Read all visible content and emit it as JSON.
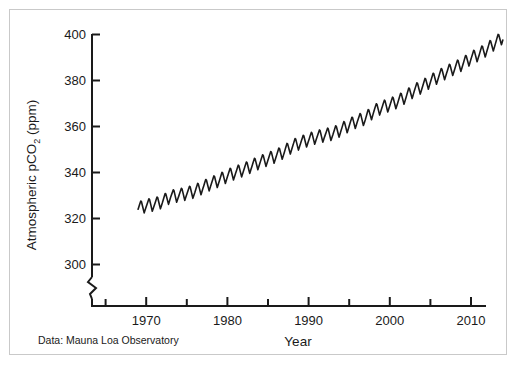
{
  "figure": {
    "background_color": "#ffffff",
    "frame_color": "#c9c9c9",
    "line_color": "#1a1a1a"
  },
  "chart_data": {
    "type": "line",
    "title": "",
    "subtitle": "",
    "xlabel": "Year",
    "ylabel": "Atmospheric pCO2 (ppm)",
    "ylabel_main": "Atmospheric pCO",
    "ylabel_sub": "2",
    "ylabel_unit": " (ppm)",
    "source_note": "Data: Mauna Loa Observatory",
    "grid": false,
    "legend": "none",
    "axis_break": true,
    "axis_break_note": "y-axis broken between 0 and 300",
    "xlim": [
      1965,
      2014
    ],
    "ylim": [
      296,
      402
    ],
    "xticks": [
      1970,
      1980,
      1990,
      2000,
      2010
    ],
    "xticks_minor": [
      1965,
      1975,
      1985,
      1995,
      2005
    ],
    "xtick_labels": [
      "1970",
      "1980",
      "1990",
      "2000",
      "2010"
    ],
    "yticks": [
      300,
      320,
      340,
      360,
      380,
      400
    ],
    "ytick_labels": [
      "300",
      "320",
      "340",
      "360",
      "380",
      "400"
    ],
    "series": [
      {
        "name": "Atmospheric pCO2 (Mauna Loa)",
        "color": "#1a1a1a",
        "description": "Keeling curve: monthly mean atmospheric CO2 with seasonal sawtooth oscillation superimposed on a rising trend",
        "seasonal_amplitude_ppm": 6.0,
        "x": [
          1969,
          1970,
          1971,
          1972,
          1973,
          1974,
          1975,
          1976,
          1977,
          1978,
          1979,
          1980,
          1981,
          1982,
          1983,
          1984,
          1985,
          1986,
          1987,
          1988,
          1989,
          1990,
          1991,
          1992,
          1993,
          1994,
          1995,
          1996,
          1997,
          1998,
          1999,
          2000,
          2001,
          2002,
          2003,
          2004,
          2005,
          2006,
          2007,
          2008,
          2009,
          2010,
          2011,
          2012,
          2013
        ],
        "annual_mean": [
          324.6,
          325.7,
          326.3,
          327.5,
          329.7,
          330.2,
          331.1,
          332.0,
          333.8,
          335.4,
          336.8,
          338.7,
          340.1,
          341.4,
          343.0,
          344.6,
          346.0,
          347.4,
          349.2,
          351.6,
          353.1,
          354.4,
          355.6,
          356.4,
          357.1,
          358.8,
          360.8,
          362.6,
          363.7,
          366.7,
          368.4,
          369.6,
          371.1,
          373.2,
          375.8,
          377.5,
          379.8,
          381.9,
          383.8,
          385.6,
          387.4,
          389.9,
          391.6,
          393.8,
          396.5
        ],
        "seasonal_min": [
          321.6,
          322.7,
          323.3,
          324.5,
          326.7,
          327.2,
          328.1,
          329.0,
          330.8,
          332.4,
          333.8,
          335.7,
          337.1,
          338.4,
          340.0,
          341.6,
          343.0,
          344.4,
          346.2,
          348.6,
          350.1,
          351.4,
          352.6,
          353.4,
          354.1,
          355.8,
          357.8,
          359.6,
          360.7,
          363.7,
          365.4,
          366.6,
          368.1,
          370.2,
          372.8,
          374.5,
          376.8,
          378.9,
          380.8,
          382.6,
          384.4,
          386.9,
          388.6,
          390.8,
          393.5
        ],
        "seasonal_max": [
          327.6,
          328.7,
          329.3,
          330.5,
          332.7,
          333.2,
          334.1,
          335.0,
          336.8,
          338.4,
          339.8,
          341.7,
          343.1,
          344.4,
          346.0,
          347.6,
          349.0,
          350.4,
          352.2,
          354.6,
          356.1,
          357.4,
          358.6,
          359.4,
          360.1,
          361.8,
          363.8,
          365.6,
          366.7,
          369.7,
          371.4,
          372.6,
          374.1,
          376.2,
          378.8,
          380.5,
          382.8,
          384.9,
          386.8,
          388.6,
          390.4,
          392.9,
          394.6,
          396.8,
          399.5
        ]
      }
    ]
  }
}
